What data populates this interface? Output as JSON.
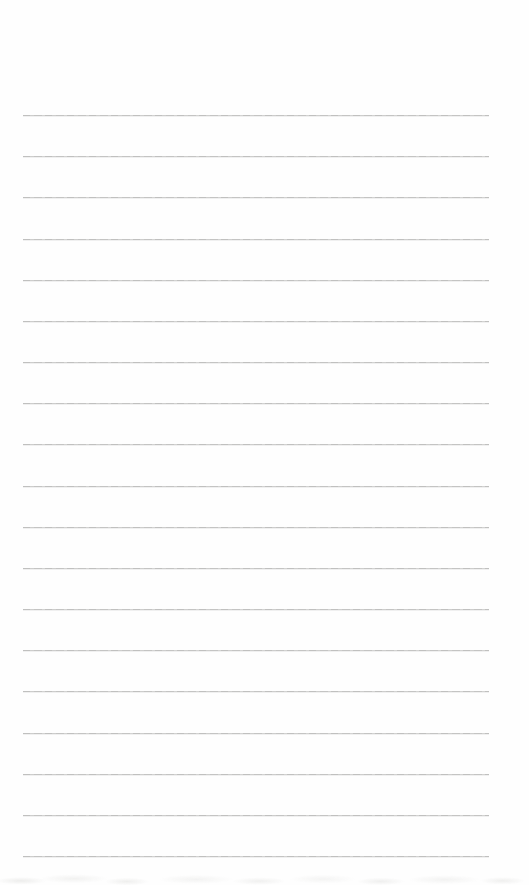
{
  "page": {
    "kind": "blank-lined-paper",
    "width_px": 529,
    "height_px": 885,
    "background_color": "#fefefe",
    "text_content": ""
  },
  "ruled_lines": {
    "count": 19,
    "color": "#c5c5c4",
    "first_line_top_px": 115,
    "last_line_top_px": 856,
    "spacing_px": 41.17,
    "left_px": 23,
    "width_px": 466,
    "thickness_px": 1
  },
  "bottom_edge": {
    "texture": "faint-gray-speckle",
    "color": "#c9c9c5",
    "height_px": 14
  }
}
